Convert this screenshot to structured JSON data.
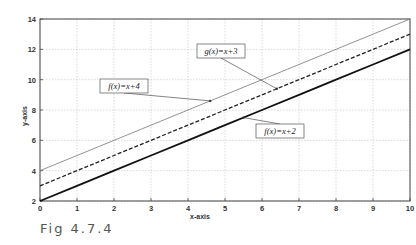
{
  "caption": "Fig 4.7.4",
  "chart_data": {
    "type": "line",
    "title": "",
    "xlabel": "x-axis",
    "ylabel": "y-axis",
    "xlim": [
      0,
      10
    ],
    "ylim": [
      2,
      14
    ],
    "xticks": [
      0,
      1,
      2,
      3,
      4,
      5,
      6,
      7,
      8,
      9,
      10
    ],
    "yticks": [
      2,
      4,
      6,
      8,
      10,
      12,
      14
    ],
    "grid": true,
    "x": [
      0,
      1,
      2,
      3,
      4,
      5,
      6,
      7,
      8,
      9,
      10
    ],
    "series": [
      {
        "name": "f(x)=x+4",
        "values": [
          4,
          5,
          6,
          7,
          8,
          9,
          10,
          11,
          12,
          13,
          14
        ],
        "style": "thin solid",
        "color": "#777777"
      },
      {
        "name": "g(x)=x+3",
        "values": [
          3,
          4,
          5,
          6,
          7,
          8,
          9,
          10,
          11,
          12,
          13
        ],
        "style": "dashed",
        "color": "#222222"
      },
      {
        "name": "f(x)=x+2",
        "values": [
          2,
          3,
          4,
          5,
          6,
          7,
          8,
          9,
          10,
          11,
          12
        ],
        "style": "thick solid",
        "color": "#111111"
      }
    ],
    "annotations": [
      {
        "text": "f(x)=x+4",
        "box": [
          100,
          79
        ],
        "arrow_to": [
          4.6,
          8.6
        ]
      },
      {
        "text": "g(x)=x+3",
        "box": [
          197,
          44
        ],
        "arrow_to": [
          6.4,
          9.4
        ]
      },
      {
        "text": "f(x)=x+2",
        "box": [
          256,
          124
        ],
        "arrow_to": [
          5.5,
          7.5
        ]
      }
    ]
  }
}
